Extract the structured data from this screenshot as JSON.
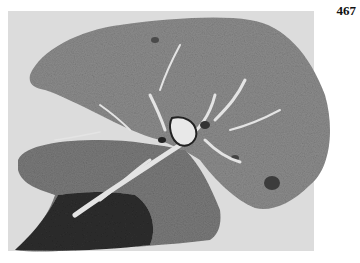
{
  "page": {
    "page_number": "467"
  },
  "figure": {
    "colors": {
      "background": "#dcdcdc",
      "tissue": "#8a8a8a",
      "tissue_dark": "#3a3a3a",
      "vessel": "#e6e6e6"
    }
  }
}
